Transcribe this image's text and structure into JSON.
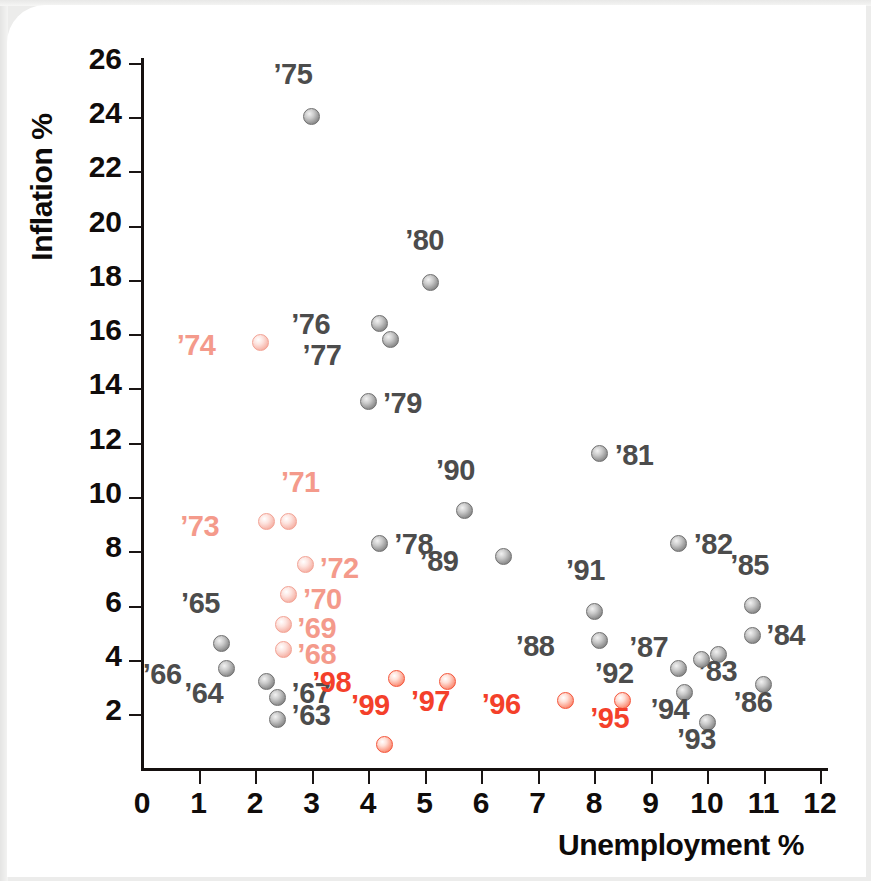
{
  "axes": {
    "x_label": "Unemployment %",
    "y_label": "Inflation %",
    "x_ticks": [
      "0",
      "1",
      "2",
      "3",
      "4",
      "5",
      "6",
      "7",
      "8",
      "9",
      "10",
      "11",
      "12"
    ],
    "y_ticks": [
      "26",
      "24",
      "22",
      "20",
      "18",
      "16",
      "14",
      "12",
      "10",
      "8",
      "6",
      "4",
      "2"
    ]
  },
  "colors": {
    "gray": "#4c4c4c",
    "pink": "#f49a8b",
    "red": "#f4402a",
    "axis": "#100c0b",
    "background": "#ffffff"
  },
  "chart_data": {
    "type": "scatter",
    "title": "",
    "xlabel": "Unemployment %",
    "ylabel": "Inflation %",
    "xlim": [
      0,
      12
    ],
    "ylim": [
      0,
      26
    ],
    "grid": false,
    "legend": "none",
    "series": [
      {
        "name": "1963-1967",
        "color": "#4c4c4c",
        "points": [
          {
            "label": "’63",
            "x": 2.4,
            "y": 1.8,
            "label_dx": 14,
            "label_dy": -14
          },
          {
            "label": "’64",
            "x": 2.2,
            "y": 3.2,
            "label_dx": -82,
            "label_dy": 2
          },
          {
            "label": "’65",
            "x": 1.4,
            "y": 4.6,
            "label_dx": -40,
            "label_dy": -50
          },
          {
            "label": "’66",
            "x": 1.5,
            "y": 3.7,
            "label_dx": -84,
            "label_dy": -3
          },
          {
            "label": "’67",
            "x": 2.4,
            "y": 2.6,
            "label_dx": 14,
            "label_dy": -14
          }
        ]
      },
      {
        "name": "1968-1974",
        "color": "#f49a8b",
        "points": [
          {
            "label": "’68",
            "x": 2.5,
            "y": 4.4,
            "label_dx": 14,
            "label_dy": -4
          },
          {
            "label": "’69",
            "x": 2.5,
            "y": 5.3,
            "label_dx": 14,
            "label_dy": -6
          },
          {
            "label": "’70",
            "x": 2.6,
            "y": 6.4,
            "label_dx": 14,
            "label_dy": -5
          },
          {
            "label": "’71",
            "x": 2.6,
            "y": 9.1,
            "label_dx": -8,
            "label_dy": -48
          },
          {
            "label": "’72",
            "x": 2.9,
            "y": 7.5,
            "label_dx": 14,
            "label_dy": -6
          },
          {
            "label": "’73",
            "x": 2.2,
            "y": 9.1,
            "label_dx": -86,
            "label_dy": -4
          },
          {
            "label": "’74",
            "x": 2.1,
            "y": 15.7,
            "label_dx": -84,
            "label_dy": -6
          }
        ]
      },
      {
        "name": "1975-1994",
        "color": "#4c4c4c",
        "points": [
          {
            "label": "’75",
            "x": 3.0,
            "y": 24.0,
            "label_dx": -38,
            "label_dy": -52
          },
          {
            "label": "’76",
            "x": 4.2,
            "y": 16.4,
            "label_dx": -88,
            "label_dy": -8
          },
          {
            "label": "’77",
            "x": 4.4,
            "y": 15.8,
            "label_dx": -88,
            "label_dy": 6
          },
          {
            "label": "’78",
            "x": 4.2,
            "y": 8.3,
            "label_dx": 15,
            "label_dy": -8
          },
          {
            "label": "’79",
            "x": 4.0,
            "y": 13.5,
            "label_dx": 15,
            "label_dy": -8
          },
          {
            "label": "’80",
            "x": 5.1,
            "y": 17.9,
            "label_dx": -25,
            "label_dy": -52
          },
          {
            "label": "’81",
            "x": 8.1,
            "y": 11.6,
            "label_dx": 15,
            "label_dy": -8
          },
          {
            "label": "’82",
            "x": 9.5,
            "y": 8.3,
            "label_dx": 15,
            "label_dy": -8
          },
          {
            "label": "’83",
            "x": 10.2,
            "y": 4.2,
            "label_dx": -20,
            "label_dy": 8
          },
          {
            "label": "’84",
            "x": 10.8,
            "y": 4.9,
            "label_dx": 14,
            "label_dy": -9
          },
          {
            "label": "’85",
            "x": 10.8,
            "y": 6.0,
            "label_dx": -22,
            "label_dy": -50
          },
          {
            "label": "’86",
            "x": 11.0,
            "y": 3.1,
            "label_dx": -30,
            "label_dy": 9
          },
          {
            "label": "’87",
            "x": 9.9,
            "y": 4.0,
            "label_dx": -72,
            "label_dy": -22
          },
          {
            "label": "’88",
            "x": 8.1,
            "y": 4.7,
            "label_dx": -84,
            "label_dy": -4
          },
          {
            "label": "’89",
            "x": 6.4,
            "y": 7.8,
            "label_dx": -84,
            "label_dy": -5
          },
          {
            "label": "’90",
            "x": 5.7,
            "y": 9.5,
            "label_dx": -28,
            "label_dy": -50
          },
          {
            "label": "’91",
            "x": 8.0,
            "y": 5.8,
            "label_dx": -28,
            "label_dy": -50
          },
          {
            "label": "’92",
            "x": 9.5,
            "y": 3.7,
            "label_dx": -84,
            "label_dy": -4
          },
          {
            "label": "’93",
            "x": 10.0,
            "y": 1.7,
            "label_dx": -30,
            "label_dy": 8
          },
          {
            "label": "’94",
            "x": 9.6,
            "y": 2.8,
            "label_dx": -34,
            "label_dy": 8
          }
        ]
      },
      {
        "name": "1995-1999",
        "color": "#f4402a",
        "points": [
          {
            "label": "’95",
            "x": 8.5,
            "y": 2.5,
            "label_dx": -32,
            "label_dy": 8
          },
          {
            "label": "’96",
            "x": 7.5,
            "y": 2.5,
            "label_dx": -84,
            "label_dy": -6
          },
          {
            "label": "’97",
            "x": 5.4,
            "y": 3.2,
            "label_dx": -36,
            "label_dy": 10
          },
          {
            "label": "’98",
            "x": 4.5,
            "y": 3.3,
            "label_dx": -84,
            "label_dy": -6
          },
          {
            "label": "’99",
            "x": 4.3,
            "y": 0.9,
            "label_dx": -34,
            "label_dy": -48
          }
        ]
      }
    ]
  }
}
